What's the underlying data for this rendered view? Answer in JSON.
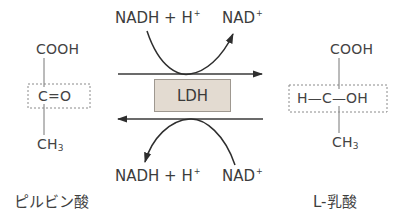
{
  "diagram": {
    "enzyme": {
      "label": "LDH",
      "fill": "#e3dbd1"
    },
    "top_cofactors": {
      "left": "NADH + H",
      "left_sup": "+",
      "right": "NAD",
      "right_sup": "+"
    },
    "bottom_cofactors": {
      "left": "NADH + H",
      "left_sup": "+",
      "right": "NAD",
      "right_sup": "+"
    },
    "pyruvate": {
      "top": "COOH",
      "middle": "C=O",
      "bottom": "CH",
      "bottom_sub": "3",
      "name": "ピルビン酸"
    },
    "lactate": {
      "top": "COOH",
      "middle": "H—C—OH",
      "bottom": "CH",
      "bottom_sub": "3",
      "name": "L-乳酸"
    },
    "arrows": {
      "forward": "pyruvate → lactate (upper arrow, pointing right)",
      "reverse": "lactate → pyruvate (lower arrow, pointing left)"
    }
  }
}
